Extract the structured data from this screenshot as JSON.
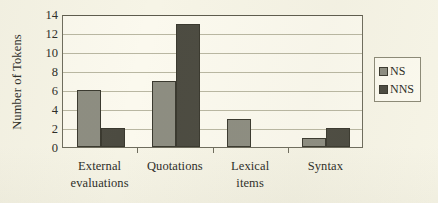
{
  "chart_data": {
    "type": "bar",
    "title": "",
    "subtitle": "",
    "xlabel": "",
    "ylabel": "Number of Tokens",
    "categories": [
      "External evaluations",
      "Quotations",
      "Lexical items",
      "Syntax"
    ],
    "category_lines": [
      [
        "External",
        "evaluations"
      ],
      [
        "Quotations",
        ""
      ],
      [
        "Lexical",
        "items"
      ],
      [
        "Syntax",
        ""
      ]
    ],
    "series": [
      {
        "name": "NS",
        "values": [
          6,
          7,
          3,
          1
        ],
        "color": "#8d8d81"
      },
      {
        "name": "NNS",
        "values": [
          2,
          13,
          0,
          2
        ],
        "color": "#4c4b41"
      }
    ],
    "ylim": [
      0,
      14
    ],
    "ytick_values": [
      0,
      2,
      4,
      6,
      8,
      10,
      12,
      14
    ],
    "ytick_labels": [
      "0",
      "2",
      "4",
      "6",
      "8",
      "10",
      "12",
      "14"
    ],
    "grid": "horizontal",
    "legend_position": "right-outside",
    "legend_entries": [
      "NS",
      "NNS"
    ]
  },
  "legend": {
    "items": [
      {
        "label": "NS",
        "swatch": "ns"
      },
      {
        "label": "NNS",
        "swatch": "nns"
      }
    ]
  },
  "colors": {
    "background": "#f6f4e6",
    "plot_background": "#fbf9ee",
    "axis": "#6e6c5d",
    "gridline": "#b9b7a2",
    "ns_bar": "#8d8d81",
    "nns_bar": "#4c4b41",
    "bar_outline": "#3a392f",
    "text": "#2b2b26"
  }
}
